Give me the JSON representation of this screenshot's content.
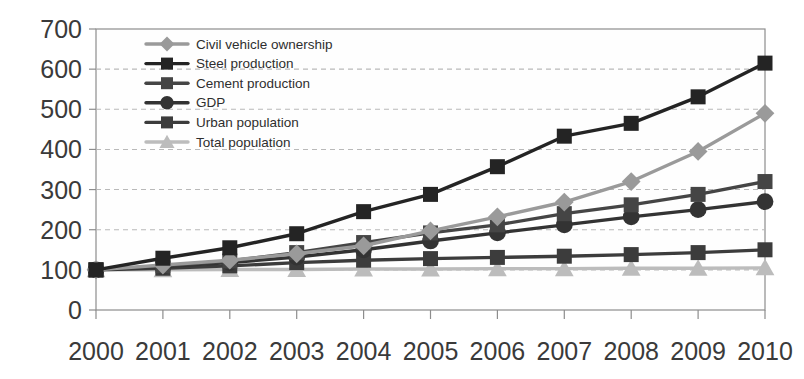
{
  "chart_data": {
    "type": "line",
    "title": "",
    "subtitle": "",
    "xlabel": "",
    "ylabel": "",
    "categories": [
      "2000",
      "2001",
      "2002",
      "2003",
      "2004",
      "2005",
      "2006",
      "2007",
      "2008",
      "2009",
      "2010"
    ],
    "x": [
      2000,
      2001,
      2002,
      2003,
      2004,
      2005,
      2006,
      2007,
      2008,
      2009,
      2010
    ],
    "ylim": [
      0,
      700
    ],
    "ytick_values": [
      0,
      100,
      200,
      300,
      400,
      500,
      600,
      700
    ],
    "ytick_labels": [
      "0",
      "100",
      "200",
      "300",
      "400",
      "500",
      "600",
      "700"
    ],
    "grid": true,
    "grid_axis": "y",
    "legend_position": "upper-left-inside",
    "series": [
      {
        "name": "Civil vehicle ownership",
        "marker": "diamond",
        "color": "#9a9a9a",
        "values": [
          100,
          112,
          124,
          140,
          160,
          197,
          232,
          269,
          320,
          395,
          490
        ]
      },
      {
        "name": "Steel production",
        "marker": "square",
        "color": "#242424",
        "values": [
          100,
          129,
          155,
          190,
          245,
          288,
          357,
          433,
          465,
          531,
          615
        ]
      },
      {
        "name": "Cement production",
        "marker": "square",
        "color": "#454545",
        "values": [
          100,
          110,
          122,
          143,
          168,
          192,
          212,
          240,
          262,
          288,
          320
        ]
      },
      {
        "name": "GDP",
        "marker": "circle",
        "color": "#333333",
        "values": [
          100,
          108,
          118,
          132,
          150,
          172,
          192,
          212,
          232,
          250,
          270
        ]
      },
      {
        "name": "Urban population",
        "marker": "square",
        "color": "#3c3c3c",
        "values": [
          100,
          104,
          110,
          118,
          124,
          128,
          131,
          134,
          138,
          143,
          150
        ]
      },
      {
        "name": "Total population",
        "marker": "triangle",
        "color": "#bcbcbc",
        "values": [
          100,
          100,
          101,
          101,
          102,
          102,
          103,
          103,
          104,
          104,
          105
        ]
      }
    ]
  },
  "legend": {
    "items": [
      {
        "label": "Civil vehicle ownership"
      },
      {
        "label": "Steel production"
      },
      {
        "label": "Cement production"
      },
      {
        "label": "GDP"
      },
      {
        "label": "Urban population"
      },
      {
        "label": "Total population"
      }
    ]
  },
  "axes": {
    "y_ticks": [
      "700",
      "600",
      "500",
      "400",
      "300",
      "200",
      "100",
      "0"
    ],
    "x_ticks": [
      "2000",
      "2001",
      "2002",
      "2003",
      "2004",
      "2005",
      "2006",
      "2007",
      "2008",
      "2009",
      "2010"
    ]
  }
}
